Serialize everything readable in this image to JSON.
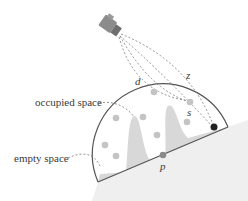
{
  "diagram": {
    "labels": {
      "occupied": "occupied space",
      "empty": "empty space",
      "d": "d",
      "z": "z",
      "s": "s",
      "p": "p"
    },
    "colors": {
      "outline": "#555555",
      "ground": "#efefef",
      "occupied_fill": "#d6d6d6",
      "dot": "#c4c4c4",
      "dark_dot": "#222222",
      "p_dot": "#8a8a8a",
      "rays": "#777777",
      "camera": "#8c8c8c"
    },
    "camera": {
      "x": 110,
      "y": 26,
      "angle": 35
    },
    "dots": [
      {
        "x": 154,
        "y": 92
      },
      {
        "x": 190,
        "y": 102
      },
      {
        "x": 116,
        "y": 118
      },
      {
        "x": 143,
        "y": 117
      },
      {
        "x": 187,
        "y": 122
      },
      {
        "x": 157,
        "y": 135
      },
      {
        "x": 105,
        "y": 145
      },
      {
        "x": 116,
        "y": 156
      }
    ],
    "surface_point": {
      "x": 214,
      "y": 127
    },
    "p_point": {
      "x": 163,
      "y": 155
    }
  }
}
